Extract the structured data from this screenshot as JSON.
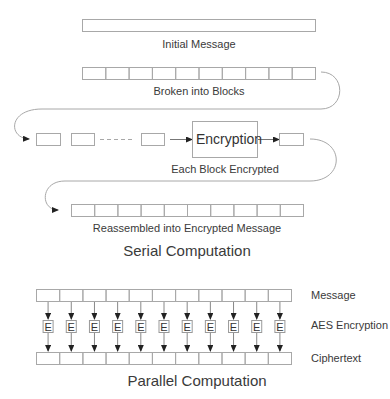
{
  "serial": {
    "title": "Serial Computation",
    "initial_label": "Initial Message",
    "blocks_label": "Broken into Blocks",
    "encrypted_label": "Each Block Encrypted",
    "reassembled_label": "Reassembled into Encrypted Message",
    "encryption_box": "Encryption",
    "block_count": 10
  },
  "parallel": {
    "title": "Parallel Computation",
    "row_labels": {
      "message": "Message",
      "aes": "AES Encryption",
      "ciphertext": "Ciphertext"
    },
    "e_label": "E",
    "block_count": 11
  },
  "colors": {
    "stroke": "#a8a8a8",
    "arrow": "#222222",
    "text": "#3a3a3a"
  }
}
